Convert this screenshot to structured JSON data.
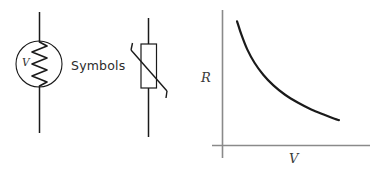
{
  "figure": {
    "background_color": "#ffffff",
    "width": 382,
    "height": 175
  },
  "caption": {
    "text": "Symbols"
  },
  "thermistor_symbol_circle": {
    "label": "V",
    "icon_name": "thermistor-circle-symbol",
    "stroke_color": "#1a1a1a",
    "description": "Circle enclosing a vertical zigzag resistor element with vertical lead wires above and below"
  },
  "thermistor_symbol_box": {
    "icon_name": "thermistor-box-symbol",
    "stroke_color": "#1a1a1a",
    "description": "Rectangular resistor body crossed by a diagonal line with hooked ends, vertical lead wires above and below"
  },
  "chart_data": {
    "type": "line",
    "title": "",
    "subtitle": "",
    "xlabel": "V",
    "ylabel": "R",
    "grid": false,
    "legend": null,
    "axis_color": "#8a8a8a",
    "curve_color": "#1a1a1a",
    "xlim": [
      0,
      10
    ],
    "ylim": [
      0,
      10
    ],
    "annotations": [],
    "tick_labels": {
      "x": [],
      "y": []
    },
    "series": [
      {
        "name": "Resistance vs voltage",
        "x": [
          1.0,
          1.3,
          1.7,
          2.2,
          2.8,
          3.5,
          4.3,
          5.2,
          6.1,
          7.0,
          7.7,
          8.0
        ],
        "y": [
          9.3,
          8.3,
          7.2,
          6.2,
          5.3,
          4.5,
          3.8,
          3.2,
          2.7,
          2.3,
          2.0,
          1.9
        ]
      }
    ]
  }
}
